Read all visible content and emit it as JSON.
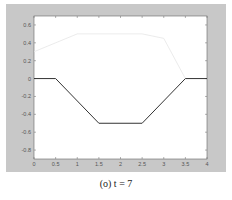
{
  "caption": "(o) t = 7",
  "chart_data": {
    "type": "line",
    "title": "",
    "xlabel": "",
    "ylabel": "",
    "xlim": [
      0,
      4
    ],
    "ylim": [
      -0.9,
      0.7
    ],
    "grid": false,
    "xticks": [
      0,
      0.5,
      1,
      1.5,
      2,
      2.5,
      3,
      3.5,
      4
    ],
    "xtick_labels": [
      "0",
      "0.5",
      "1",
      "1.5",
      "2",
      "2.5",
      "3",
      "3.5",
      "4"
    ],
    "yticks": [
      0.6,
      0.4,
      0.2,
      0,
      -0.2,
      -0.4,
      -0.6,
      -0.8
    ],
    "ytick_labels": [
      "0.6",
      "0.4",
      "0.2",
      "0",
      "-0.2",
      "-0.4",
      "-0.6",
      "-0.8"
    ],
    "series": [
      {
        "name": "solution",
        "color": "#333333",
        "x": [
          0,
          0.5,
          1.5,
          2.5,
          3.5,
          4
        ],
        "y": [
          0,
          0,
          -0.5,
          -0.5,
          0,
          0
        ]
      },
      {
        "name": "faint reference",
        "color": "#e6e6e6",
        "x": [
          0,
          1.0,
          2.5,
          3.0,
          3.5
        ],
        "y": [
          0.3,
          0.5,
          0.5,
          0.45,
          0.0
        ]
      }
    ]
  }
}
